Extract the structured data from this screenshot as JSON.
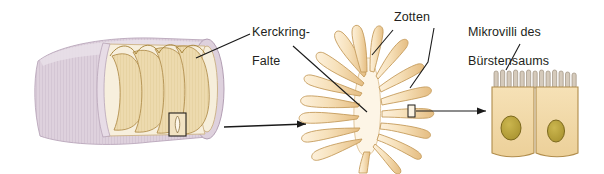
{
  "figure": {
    "title_visible": false,
    "background_color": "#ffffff",
    "panels": [
      {
        "id": "panel-intestine-tube",
        "name": "intestinal-tube-with-kerckring-folds",
        "magnification_step": 1,
        "colors": {
          "serosa_outer": "#ddd0dc",
          "serosa_shade": "#cfc0cf",
          "mucosa_fold": "#ecd9ad",
          "fold_outline": "#a98a55",
          "lumen_inner": "#f6ead0"
        },
        "fold_count": 4,
        "marker_box": true
      },
      {
        "id": "panel-villi",
        "name": "villi-rosette-cross-section",
        "magnification_step": 2,
        "colors": {
          "villus_fill": "#f7e2bd",
          "villus_shade": "#e8c48e",
          "villus_outline": "#c89d5c",
          "core_fill": "#fdf3e2"
        },
        "villi_count": 22,
        "marker_box": true
      },
      {
        "id": "panel-epithelial-cells",
        "name": "epithelial-cells-with-microvilli",
        "magnification_step": 3,
        "colors": {
          "cell_fill": "#f2d9a8",
          "cell_outline": "#b8914f",
          "nucleus_fill": "#b8a23c",
          "nucleus_outline": "#7d6a1e",
          "microvilli_fill": "#d9cfc0"
        },
        "cell_count": 2,
        "microvilli_count": 13,
        "nuclei_count": 2
      }
    ]
  },
  "labels": {
    "kerckring": "Kerckring-\nFalte",
    "kerckring_line1": "Kerckring-",
    "kerckring_line2": "Falte",
    "zotten": "Zotten",
    "mikrovilli": "Mikrovilli des\nBürstensaums",
    "mikrovilli_line1": "Mikrovilli des",
    "mikrovilli_line2": "Bürstensaums"
  },
  "connectors": {
    "leader_color": "#1a1a1a",
    "arrow_color": "#1a1a1a",
    "items": [
      {
        "name": "leader-kerckring-to-tube-fold",
        "type": "leader-line",
        "arrowhead": false
      },
      {
        "name": "leader-kerckring-to-villi-core",
        "type": "leader-line",
        "arrowhead": false
      },
      {
        "name": "leader-zotten-to-upper-villus",
        "type": "leader-line",
        "arrowhead": false
      },
      {
        "name": "leader-zotten-to-right-villus",
        "type": "leader-line",
        "arrowhead": false
      },
      {
        "name": "leader-mikrovilli-to-brush-border",
        "type": "leader-line",
        "arrowhead": false
      },
      {
        "name": "arrow-tube-to-villi",
        "type": "magnification-arrow",
        "arrowhead": true
      },
      {
        "name": "arrow-villi-to-cells",
        "type": "magnification-arrow",
        "arrowhead": true
      }
    ]
  },
  "icons": {
    "marker_box_tube": "marker-box-icon",
    "marker_box_villus": "marker-box-icon"
  }
}
